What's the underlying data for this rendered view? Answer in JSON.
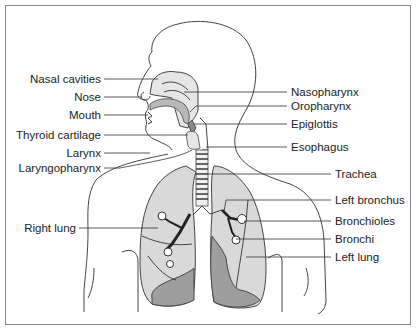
{
  "diagram": {
    "colors": {
      "lung_light": "#d9d9d9",
      "lung_dark": "#9e9e9e",
      "airway_fill": "#e6e6e6",
      "outline": "#444444",
      "frame": "#8a8a8a"
    },
    "labels_left": [
      {
        "text": "Nasal cavities",
        "target": "nasal-cavities"
      },
      {
        "text": "Nose",
        "target": "nose"
      },
      {
        "text": "Mouth",
        "target": "mouth"
      },
      {
        "text": "Thyroid cartilage",
        "target": "thyroid-cartilage"
      },
      {
        "text": "Larynx",
        "target": "larynx"
      },
      {
        "text": "Laryngopharynx",
        "target": "laryngopharynx"
      },
      {
        "text": "Right lung",
        "target": "right-lung"
      }
    ],
    "labels_right": [
      {
        "text": "Nasopharynx",
        "target": "nasopharynx"
      },
      {
        "text": "Oropharynx",
        "target": "oropharynx"
      },
      {
        "text": "Epiglottis",
        "target": "epiglottis"
      },
      {
        "text": "Esophagus",
        "target": "esophagus"
      },
      {
        "text": "Trachea",
        "target": "trachea"
      },
      {
        "text": "Left bronchus",
        "target": "left-bronchus"
      },
      {
        "text": "Bronchioles",
        "target": "bronchioles"
      },
      {
        "text": "Bronchi",
        "target": "bronchi"
      },
      {
        "text": "Left lung",
        "target": "left-lung"
      }
    ]
  }
}
